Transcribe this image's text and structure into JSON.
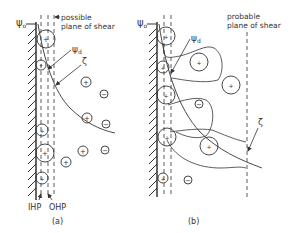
{
  "panel_a": {
    "psi_0": "ψ",
    "psi_0_sub": "o",
    "psi_d": "ψ",
    "psi_d_sub": "d",
    "zeta": "ζ",
    "shear_label_line1": "possible",
    "shear_label_line2": "plane of shear",
    "ihp": "IHP",
    "ohp": "OHP",
    "caption": "(a)"
  },
  "panel_b": {
    "psi_0": "ψ",
    "psi_0_sub": "o",
    "psi_d": "ψ",
    "psi_d_sub": "d",
    "zeta": "ζ",
    "shear_label_line1": "probable",
    "shear_label_line2": "plane of shear",
    "caption": "(b)"
  },
  "colors": {
    "ink": "#333333",
    "background": "#ffffff"
  }
}
